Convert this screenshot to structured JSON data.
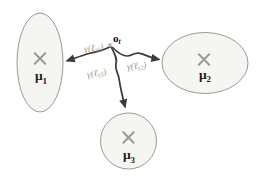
{
  "figure": {
    "origin": {
      "label": "o",
      "subscript": "t"
    },
    "clusters": [
      {
        "label": "μ",
        "subscript": "1"
      },
      {
        "label": "μ",
        "subscript": "2"
      },
      {
        "label": "μ",
        "subscript": "3"
      }
    ],
    "edges": [
      {
        "label_pre": "γ(ℓ",
        "label_sub": "t1",
        "label_post": ")"
      },
      {
        "label_pre": "γ(ℓ",
        "label_sub": "t2",
        "label_post": ")"
      },
      {
        "label_pre": "γ(ℓ",
        "label_sub": "t3",
        "label_post": ")"
      }
    ],
    "colors": {
      "background": "#ffffff",
      "ellipse_fill": "#f5f5f2",
      "ellipse_stroke": "#8e8e8c",
      "curve": "#3b3b3b",
      "x_marker": "#9b9b99",
      "mu_label": "#1c1c1c",
      "origin_label": "#111111",
      "origin_dot": "#b6b6b0",
      "gamma_label": "#a69786"
    }
  }
}
